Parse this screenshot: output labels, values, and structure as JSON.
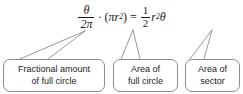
{
  "figure": {
    "background_color": "#ffffff",
    "box_border_color": "#8c8c8c",
    "text_color": "#1a1a1a"
  },
  "equation": {
    "full_text": "(θ / 2π) · (π r²) = ½ r² θ",
    "left_fraction": {
      "numerator": "θ",
      "denominator": "2π"
    },
    "multiply_operator": "·",
    "open_paren": "(",
    "pi_symbol": "π",
    "radius_symbol": "r",
    "radius_exponent": "2",
    "close_paren": ")",
    "equals": "=",
    "right_fraction": {
      "numerator": "1",
      "denominator": "2"
    },
    "right_radius_symbol": "r",
    "right_radius_exponent": "2",
    "theta_symbol": "θ"
  },
  "callouts": [
    {
      "id": "fractional-amount",
      "line1": "Fractional amount",
      "line2": "of full circle"
    },
    {
      "id": "area-of-full-circle",
      "line1": "Area of",
      "line2": "full circle"
    },
    {
      "id": "area-of-sector",
      "line1": "Area of",
      "line2": "sector"
    }
  ]
}
